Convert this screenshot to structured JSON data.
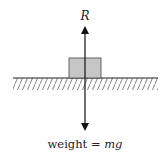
{
  "diagram": {
    "title": "",
    "labels": {
      "reaction_force": "R",
      "weight_text": "weight = ",
      "weight_symbol": "mg"
    },
    "colors": {
      "block_fill": "#c6c6c6",
      "block_stroke": "#444444",
      "line": "#222222",
      "hatch": "#555555"
    }
  }
}
